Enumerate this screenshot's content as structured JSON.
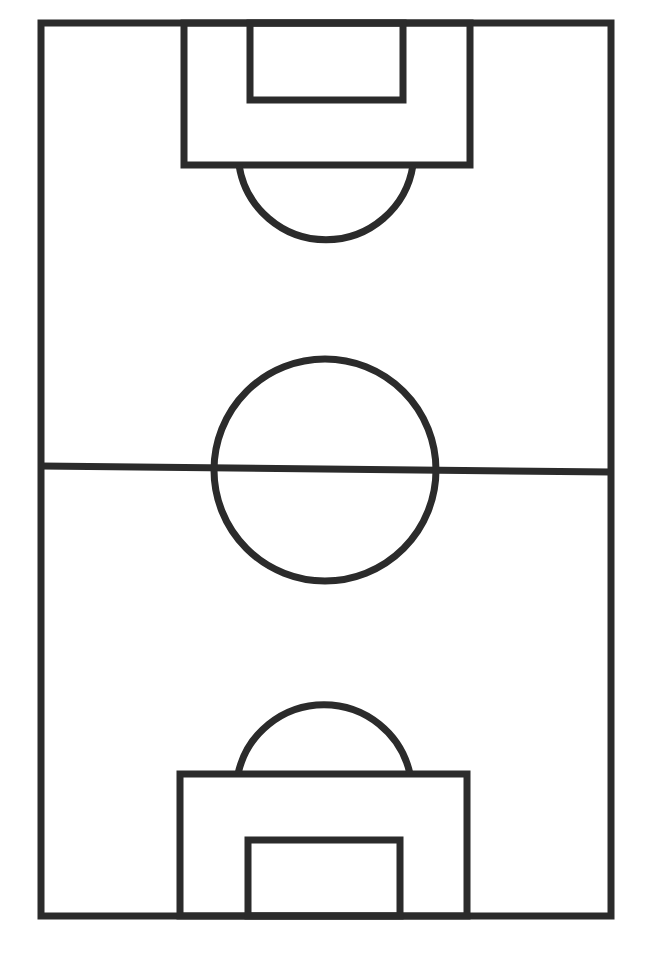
{
  "diagram": {
    "title": "Soccer pitch outline",
    "orientation": "vertical",
    "canvas": {
      "width": 655,
      "height": 963,
      "background": "#ffffff"
    },
    "line_color": "#2b2b2b",
    "line_width": 7,
    "elements": {
      "touchline_boundary": {
        "x1": 41,
        "y1": 23,
        "x2": 611,
        "y2": 916
      },
      "halfway_line": {
        "x1": 41,
        "y1": 466,
        "x2": 611,
        "y2": 472
      },
      "center_circle": {
        "cx": 325,
        "cy": 470,
        "r": 111
      },
      "top_penalty_area": {
        "x1": 184,
        "y1": 23,
        "x2": 470,
        "y2": 165
      },
      "top_goal_area": {
        "x1": 250,
        "y1": 23,
        "x2": 403,
        "y2": 100
      },
      "top_penalty_arc": {
        "cx": 325,
        "cy": 140,
        "r": 88,
        "start_x": 239,
        "end_x": 413,
        "y": 165
      },
      "bottom_penalty_area": {
        "x1": 180,
        "y1": 774,
        "x2": 467,
        "y2": 916
      },
      "bottom_goal_area": {
        "x1": 248,
        "y1": 840,
        "x2": 400,
        "y2": 916
      },
      "bottom_penalty_arc": {
        "cx": 324,
        "cy": 800,
        "r": 88,
        "start_x": 238,
        "end_x": 410,
        "y": 774
      }
    }
  }
}
